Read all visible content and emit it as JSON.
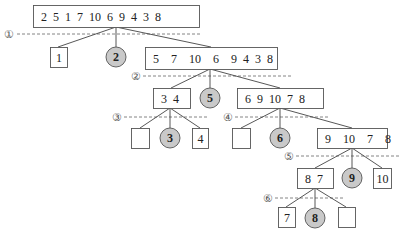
{
  "diagram": {
    "title": "",
    "colors": {
      "line": "#444444",
      "box_border": "#555555",
      "box_fill": "#ffffff",
      "pivot_fill": "#c9c9c9",
      "pivot_border": "#555555",
      "dash": "#666666",
      "text": "#222222"
    },
    "levels": [
      {
        "label": "①",
        "y": 34,
        "x1": 17,
        "x2": 200,
        "lx": 9
      },
      {
        "label": "②",
        "y": 76,
        "x1": 143,
        "x2": 292,
        "lx": 136
      },
      {
        "label": "③",
        "y": 117,
        "x1": 124,
        "x2": 208,
        "lx": 117
      },
      {
        "label": "④",
        "y": 117,
        "x1": 235,
        "x2": 330,
        "lx": 228
      },
      {
        "label": "⑤",
        "y": 156,
        "x1": 296,
        "x2": 400,
        "lx": 289
      },
      {
        "label": "⑥",
        "y": 198,
        "x1": 275,
        "x2": 344,
        "lx": 268
      }
    ],
    "nodes": [
      {
        "id": "root",
        "type": "box",
        "text": "2  5  1  7  10  6  9  4  3  8",
        "x": 33,
        "y": 5,
        "w": 166,
        "h": 22
      },
      {
        "id": "n1",
        "type": "box",
        "text": "1",
        "x": 50,
        "y": 47,
        "w": 17,
        "h": 20
      },
      {
        "id": "p2",
        "type": "pivot",
        "text": "2",
        "cx": 116,
        "cy": 57,
        "r": 10
      },
      {
        "id": "n5710",
        "type": "box",
        "text": "5    7    10    6    9  4  3  8",
        "x": 145,
        "y": 47,
        "w": 132,
        "h": 22
      },
      {
        "id": "n34",
        "type": "box",
        "text": "3  4",
        "x": 153,
        "y": 88,
        "w": 37,
        "h": 20
      },
      {
        "id": "p5",
        "type": "pivot",
        "text": "5",
        "cx": 210,
        "cy": 98,
        "r": 10
      },
      {
        "id": "n69",
        "type": "box",
        "text": "6  9  10  7  8",
        "x": 237,
        "y": 88,
        "w": 86,
        "h": 20
      },
      {
        "id": "e3a",
        "type": "box",
        "text": "",
        "x": 131,
        "y": 128,
        "w": 18,
        "h": 20
      },
      {
        "id": "p3",
        "type": "pivot",
        "text": "3",
        "cx": 170,
        "cy": 138,
        "r": 10
      },
      {
        "id": "n4",
        "type": "box",
        "text": "4",
        "x": 192,
        "y": 128,
        "w": 16,
        "h": 20
      },
      {
        "id": "e4a",
        "type": "box",
        "text": "",
        "x": 232,
        "y": 128,
        "w": 18,
        "h": 20
      },
      {
        "id": "p6",
        "type": "pivot",
        "text": "6",
        "cx": 280,
        "cy": 138,
        "r": 10
      },
      {
        "id": "n910",
        "type": "box",
        "text": "9    10    7    8",
        "x": 317,
        "y": 128,
        "w": 70,
        "h": 20
      },
      {
        "id": "n87",
        "type": "box",
        "text": "8  7",
        "x": 297,
        "y": 168,
        "w": 36,
        "h": 20
      },
      {
        "id": "p9",
        "type": "pivot",
        "text": "9",
        "cx": 352,
        "cy": 178,
        "r": 10
      },
      {
        "id": "n10",
        "type": "box",
        "text": "10",
        "x": 373,
        "y": 168,
        "w": 18,
        "h": 20
      },
      {
        "id": "n7",
        "type": "box",
        "text": "7",
        "x": 278,
        "y": 207,
        "w": 17,
        "h": 20
      },
      {
        "id": "p8",
        "type": "pivot",
        "text": "8",
        "cx": 315,
        "cy": 218,
        "r": 10
      },
      {
        "id": "e8a",
        "type": "box",
        "text": "",
        "x": 338,
        "y": 207,
        "w": 17,
        "h": 20
      }
    ],
    "edges": [
      {
        "from": [
          116,
          27
        ],
        "to": [
          58,
          47
        ]
      },
      {
        "from": [
          116,
          27
        ],
        "to": [
          116,
          47
        ]
      },
      {
        "from": [
          116,
          27
        ],
        "to": [
          211,
          47
        ]
      },
      {
        "from": [
          210,
          69
        ],
        "to": [
          171,
          88
        ]
      },
      {
        "from": [
          210,
          69
        ],
        "to": [
          210,
          88
        ]
      },
      {
        "from": [
          210,
          69
        ],
        "to": [
          280,
          88
        ]
      },
      {
        "from": [
          170,
          108
        ],
        "to": [
          140,
          128
        ]
      },
      {
        "from": [
          170,
          108
        ],
        "to": [
          170,
          128
        ]
      },
      {
        "from": [
          170,
          108
        ],
        "to": [
          200,
          128
        ]
      },
      {
        "from": [
          280,
          108
        ],
        "to": [
          241,
          128
        ]
      },
      {
        "from": [
          280,
          108
        ],
        "to": [
          280,
          128
        ]
      },
      {
        "from": [
          280,
          108
        ],
        "to": [
          352,
          128
        ]
      },
      {
        "from": [
          352,
          148
        ],
        "to": [
          315,
          168
        ]
      },
      {
        "from": [
          352,
          148
        ],
        "to": [
          352,
          168
        ]
      },
      {
        "from": [
          352,
          148
        ],
        "to": [
          382,
          168
        ]
      },
      {
        "from": [
          315,
          188
        ],
        "to": [
          286,
          207
        ]
      },
      {
        "from": [
          315,
          188
        ],
        "to": [
          315,
          208
        ]
      },
      {
        "from": [
          315,
          188
        ],
        "to": [
          346,
          207
        ]
      }
    ]
  }
}
